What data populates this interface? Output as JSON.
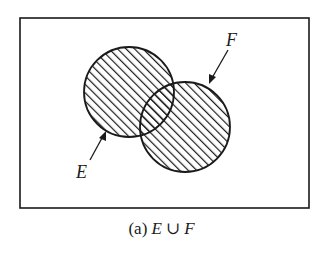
{
  "diagram": {
    "type": "venn",
    "universe_frame": {
      "x": 20,
      "y": 18,
      "width": 289,
      "height": 190
    },
    "sets": [
      {
        "id": "E",
        "label": "E",
        "center": [
          129,
          92
        ],
        "radius": 45,
        "shaded": true
      },
      {
        "id": "F",
        "label": "F",
        "center": [
          185,
          127
        ],
        "radius": 45,
        "shaded": true
      }
    ],
    "shaded_region": "E ∪ F",
    "hatch_pattern": {
      "angle_deg": 45,
      "spacing_px": 6
    },
    "labels": {
      "E": "E",
      "F": "F"
    },
    "caption": {
      "prefix": "(a)",
      "left_set": "E",
      "operator": "∪",
      "right_set": "F"
    },
    "colors": {
      "stroke": "#1a1a1a",
      "background": "#ffffff"
    }
  }
}
